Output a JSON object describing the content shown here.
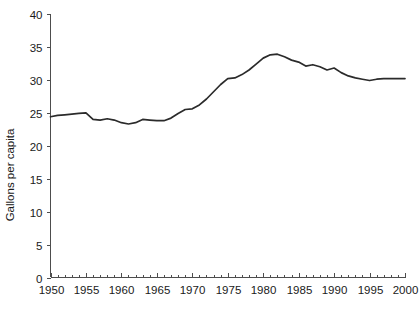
{
  "chart_data": {
    "type": "line",
    "title": "",
    "xlabel": "",
    "ylabel": "Gallons per capita",
    "xlim": [
      1950,
      2000
    ],
    "ylim": [
      0,
      40
    ],
    "grid": false,
    "legend": "none",
    "x_ticks": [
      1950,
      1955,
      1960,
      1965,
      1970,
      1975,
      1980,
      1985,
      1990,
      1995,
      2000
    ],
    "x_tick_labels": [
      "1950",
      "1955",
      "1960",
      "1965",
      "1970",
      "1975",
      "1980",
      "1985",
      "1990",
      "1995",
      "2000"
    ],
    "x_minor_tick_step": 1,
    "y_ticks": [
      0,
      5,
      10,
      15,
      20,
      25,
      30,
      35,
      40
    ],
    "y_tick_labels": [
      "0",
      "5",
      "10",
      "15",
      "20",
      "25",
      "30",
      "35",
      "40"
    ],
    "line_color": "#2b2b2b",
    "axis_color": "#4d4d4d",
    "series": [
      {
        "name": "Gallons per capita",
        "x": [
          1950,
          1951,
          1952,
          1953,
          1954,
          1955,
          1956,
          1957,
          1958,
          1959,
          1960,
          1961,
          1962,
          1963,
          1964,
          1965,
          1966,
          1967,
          1968,
          1969,
          1970,
          1971,
          1972,
          1973,
          1974,
          1975,
          1976,
          1977,
          1978,
          1979,
          1980,
          1981,
          1982,
          1983,
          1984,
          1985,
          1986,
          1987,
          1988,
          1989,
          1990,
          1991,
          1992,
          1993,
          1994,
          1995,
          1996,
          1997,
          1998,
          1999,
          2000
        ],
        "values": [
          24.4,
          24.6,
          24.7,
          24.8,
          24.9,
          25.0,
          24.0,
          23.9,
          24.1,
          23.9,
          23.5,
          23.3,
          23.5,
          24.0,
          23.9,
          23.8,
          23.8,
          24.2,
          24.9,
          25.5,
          25.6,
          26.2,
          27.1,
          28.2,
          29.3,
          30.2,
          30.3,
          30.8,
          31.5,
          32.4,
          33.3,
          33.8,
          33.9,
          33.5,
          33.0,
          32.7,
          32.1,
          32.3,
          32.0,
          31.5,
          31.8,
          31.1,
          30.6,
          30.3,
          30.1,
          29.9,
          30.1,
          30.2,
          30.2,
          30.2,
          30.2
        ]
      }
    ]
  },
  "axes": {
    "y_title": "Gallons per capita"
  }
}
